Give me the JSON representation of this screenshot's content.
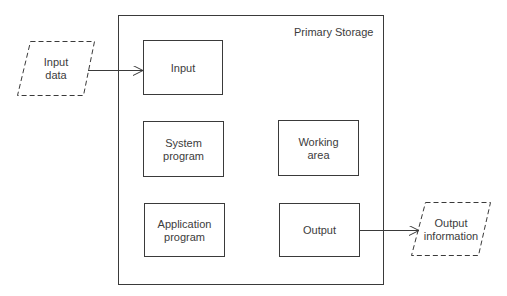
{
  "diagram": {
    "container": {
      "title": "Primary Storage"
    },
    "boxes": {
      "input": {
        "line1": "Input",
        "line2": ""
      },
      "system_program": {
        "line1": "System",
        "line2": "program"
      },
      "application_program": {
        "line1": "Application",
        "line2": "program"
      },
      "working_area": {
        "line1": "Working",
        "line2": "area"
      },
      "output": {
        "line1": "Output",
        "line2": ""
      }
    },
    "external": {
      "input_data": {
        "line1": "Input",
        "line2": "data"
      },
      "output_information": {
        "line1": "Output",
        "line2": "information"
      }
    },
    "colors": {
      "stroke": "#3a3a3a",
      "text": "#3c3c3c",
      "background": "#ffffff"
    }
  }
}
